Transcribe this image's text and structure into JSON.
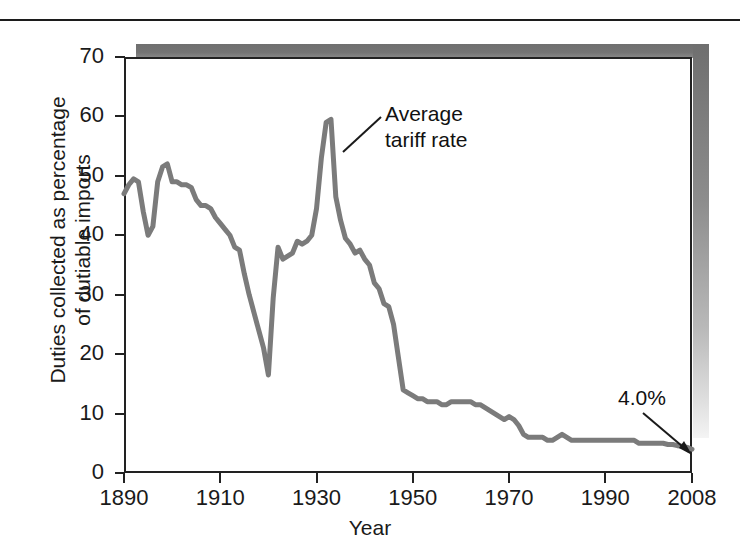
{
  "figure": {
    "rule_name": "top-divider"
  },
  "chart_data": {
    "type": "line",
    "title": "",
    "xlabel": "Year",
    "ylabel": "Duties collected as percentage\nof dutiable imports",
    "xlim": [
      1890,
      2008
    ],
    "ylim": [
      0,
      70
    ],
    "grid": false,
    "legend": "none",
    "line_color": "#7b7b7b",
    "axis_color": "#222222",
    "xticks": [
      1890,
      1910,
      1930,
      1950,
      1970,
      1990,
      2008
    ],
    "xtick_labels": [
      "1890",
      "1910",
      "1930",
      "1950",
      "1970",
      "1990",
      "2008"
    ],
    "yticks": [
      0,
      10,
      20,
      30,
      40,
      50,
      60,
      70
    ],
    "ytick_labels": [
      "0",
      "10",
      "20",
      "30",
      "40",
      "50",
      "60",
      "70"
    ],
    "series": [
      {
        "name": "Average tariff rate",
        "x": [
          1890,
          1891,
          1892,
          1893,
          1894,
          1895,
          1896,
          1897,
          1898,
          1899,
          1900,
          1901,
          1902,
          1903,
          1904,
          1905,
          1906,
          1907,
          1908,
          1909,
          1910,
          1911,
          1912,
          1913,
          1914,
          1915,
          1916,
          1917,
          1918,
          1919,
          1920,
          1921,
          1922,
          1923,
          1924,
          1925,
          1926,
          1927,
          1928,
          1929,
          1930,
          1931,
          1932,
          1933,
          1934,
          1935,
          1936,
          1937,
          1938,
          1939,
          1940,
          1941,
          1942,
          1943,
          1944,
          1945,
          1946,
          1947,
          1948,
          1949,
          1950,
          1951,
          1952,
          1953,
          1954,
          1955,
          1956,
          1957,
          1958,
          1959,
          1960,
          1961,
          1962,
          1963,
          1964,
          1965,
          1966,
          1967,
          1968,
          1969,
          1970,
          1971,
          1972,
          1973,
          1974,
          1975,
          1976,
          1977,
          1978,
          1979,
          1980,
          1981,
          1982,
          1983,
          1984,
          1985,
          1986,
          1987,
          1988,
          1989,
          1990,
          1991,
          1992,
          1993,
          1994,
          1995,
          1996,
          1997,
          1998,
          1999,
          2000,
          2001,
          2002,
          2003,
          2004,
          2005,
          2006,
          2007,
          2008
        ],
        "values": [
          47.0,
          48.5,
          49.5,
          49.0,
          44.0,
          40.0,
          41.5,
          49.0,
          51.5,
          52.0,
          49.0,
          49.0,
          48.5,
          48.5,
          48.0,
          46.0,
          45.0,
          45.0,
          44.5,
          43.0,
          42.0,
          41.0,
          40.0,
          38.0,
          37.5,
          33.5,
          30.0,
          27.0,
          24.0,
          21.0,
          16.5,
          29.5,
          38.0,
          36.0,
          36.5,
          37.0,
          39.0,
          38.5,
          39.0,
          40.0,
          44.5,
          53.0,
          59.0,
          59.5,
          46.5,
          42.5,
          39.5,
          38.5,
          37.0,
          37.5,
          36.0,
          35.0,
          32.0,
          31.0,
          28.5,
          28.0,
          25.0,
          19.5,
          14.0,
          13.5,
          13.0,
          12.5,
          12.5,
          12.0,
          12.0,
          12.0,
          11.5,
          11.5,
          12.0,
          12.0,
          12.0,
          12.0,
          12.0,
          11.5,
          11.5,
          11.0,
          10.5,
          10.0,
          9.5,
          9.0,
          9.5,
          9.0,
          8.0,
          6.5,
          6.0,
          6.0,
          6.0,
          6.0,
          5.5,
          5.5,
          6.0,
          6.5,
          6.0,
          5.5,
          5.5,
          5.5,
          5.5,
          5.5,
          5.5,
          5.5,
          5.5,
          5.5,
          5.5,
          5.5,
          5.5,
          5.5,
          5.5,
          5.0,
          5.0,
          5.0,
          5.0,
          5.0,
          5.0,
          4.8,
          4.8,
          4.6,
          4.5,
          4.3,
          4.0
        ]
      }
    ],
    "annotations": [
      {
        "name": "series-callout",
        "text": "Average\ntariff rate",
        "points_to_year": 1932,
        "points_to_value": 50
      },
      {
        "name": "endpoint-callout",
        "text": "4.0%",
        "points_to_year": 2008,
        "points_to_value": 4.0
      }
    ]
  }
}
